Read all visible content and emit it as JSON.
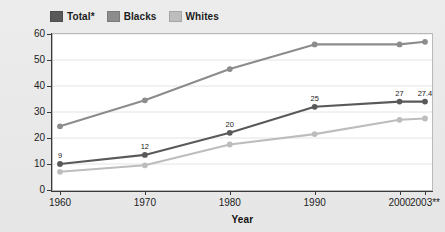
{
  "chart_data": {
    "type": "line",
    "title": "",
    "xlabel": "Year",
    "ylabel": "Percent",
    "categories": [
      "1960",
      "1970",
      "1980",
      "1990",
      "2000",
      "2003**"
    ],
    "x_positions": [
      1960,
      1970,
      1980,
      1990,
      2000,
      2003
    ],
    "xlim": [
      1960,
      2003
    ],
    "ylim": [
      0,
      60
    ],
    "yticks": [
      0,
      10,
      20,
      30,
      40,
      50,
      60
    ],
    "ytick_labels": [
      "0",
      "10",
      "20",
      "30",
      "40",
      "50",
      "60"
    ],
    "grid": "horizontal",
    "legend_position": "top-left",
    "markers": true,
    "series": [
      {
        "name": "Total*",
        "color": "#595959",
        "values": [
          10,
          13.5,
          22,
          32,
          34,
          34
        ],
        "data_labels": [
          "9",
          "12",
          "20",
          "25",
          "27",
          "27.4"
        ]
      },
      {
        "name": "Blacks",
        "color": "#8c8c8c",
        "values": [
          24.5,
          34.5,
          46.5,
          56,
          56,
          57
        ],
        "data_labels": [
          "",
          "",
          "",
          "",
          "",
          ""
        ]
      },
      {
        "name": "Whites",
        "color": "#bdbdbd",
        "values": [
          7,
          9.5,
          17.5,
          21.5,
          27,
          27.5
        ],
        "data_labels": [
          "",
          "",
          "",
          "",
          "",
          ""
        ]
      }
    ]
  },
  "legend": {
    "items": [
      {
        "label": "Total*",
        "color": "#595959"
      },
      {
        "label": "Blacks",
        "color": "#8c8c8c"
      },
      {
        "label": "Whites",
        "color": "#bdbdbd"
      }
    ]
  },
  "axes": {
    "y_title": "Percent",
    "x_title": "Year"
  },
  "colors": {
    "background": "#e9e9e9",
    "plot_background": "#ffffff",
    "gridline": "#e4e4e4",
    "axis": "#3a3a3a",
    "text": "#1d1d1d"
  }
}
